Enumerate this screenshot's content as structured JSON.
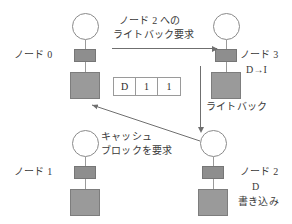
{
  "diagram": {
    "colors": {
      "node_fill": "#9a9a9a",
      "cache_fill": "#8e8e8e",
      "line": "#6f6f6f",
      "text": "#3a3a3a",
      "background": "#ffffff"
    },
    "nodes": [
      {
        "id": "node0",
        "label": "ノード 0",
        "state": "",
        "note": ""
      },
      {
        "id": "node3",
        "label": "ノード 3",
        "state": "D→I",
        "note": ""
      },
      {
        "id": "node1",
        "label": "ノード 1",
        "state": "",
        "note": ""
      },
      {
        "id": "node2",
        "label": "ノード 2",
        "state": "D",
        "note": "書き込み"
      }
    ],
    "arrows": [
      {
        "id": "writeback-request",
        "direction": "right",
        "label_line1": "ノード 2 への",
        "label_line2": "ライトバック要求"
      },
      {
        "id": "writeback",
        "direction": "down",
        "label_line1": "ライトバック",
        "label_line2": ""
      },
      {
        "id": "cache-block-request",
        "direction": "up-left",
        "label_line1": "キャッシュ",
        "label_line2": "ブロックを要求"
      }
    ],
    "state_table": {
      "id": "directory-entry",
      "cells": [
        "D",
        "1",
        "1"
      ]
    }
  }
}
